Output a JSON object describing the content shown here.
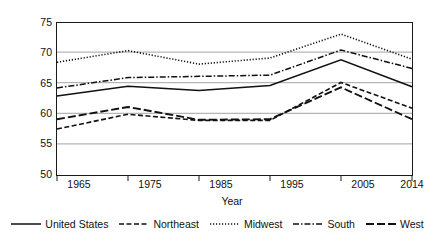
{
  "chart_data": {
    "type": "line",
    "title": "",
    "xlabel": "Year",
    "ylabel": "Homeownership rate (%)",
    "categories": [
      "1965",
      "1975",
      "1985",
      "1995",
      "2005",
      "2014"
    ],
    "x": [
      1965,
      1975,
      1985,
      1995,
      2005,
      2014
    ],
    "ylim": [
      50,
      75
    ],
    "yticks": [
      "50",
      "55",
      "60",
      "65",
      "70",
      "75"
    ],
    "ytick_values": [
      50,
      55,
      60,
      65,
      70,
      75
    ],
    "grid": "horizontal",
    "legend_position": "bottom",
    "series": [
      {
        "name": "United States",
        "style": "solid",
        "values": [
          63.0,
          64.6,
          63.9,
          64.7,
          68.9,
          64.5
        ]
      },
      {
        "name": "Northeast",
        "style": "dashed",
        "values": [
          57.6,
          60.0,
          59.0,
          59.0,
          65.2,
          61.0
        ]
      },
      {
        "name": "Midwest",
        "style": "dotted",
        "values": [
          68.5,
          70.4,
          68.2,
          69.2,
          73.1,
          69.0
        ]
      },
      {
        "name": "South",
        "style": "dash-dot",
        "values": [
          64.3,
          66.0,
          66.2,
          66.4,
          70.5,
          67.5
        ]
      },
      {
        "name": "West",
        "style": "long-dash",
        "values": [
          59.2,
          61.2,
          59.1,
          59.2,
          64.4,
          59.2
        ]
      }
    ]
  }
}
